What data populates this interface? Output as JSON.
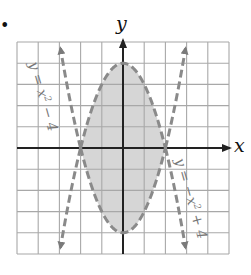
{
  "bullet": "•",
  "chart_data": {
    "type": "line",
    "title": "",
    "xlabel": "x",
    "ylabel": "y",
    "xlim": [
      -5,
      5
    ],
    "ylim": [
      -5,
      5
    ],
    "grid": true,
    "grid_step": 1,
    "shaded_region": "region between y = x^2 - 4 and y = -x^2 + 4 for -2 < x < 2",
    "intersections": [
      [
        -2,
        0
      ],
      [
        2,
        0
      ]
    ],
    "series": [
      {
        "name": "y = x^2 - 4",
        "style": "dashed",
        "vertex": [
          0,
          -4
        ],
        "points": [
          [
            -3,
            5
          ],
          [
            -2,
            0
          ],
          [
            -1,
            -3
          ],
          [
            0,
            -4
          ],
          [
            1,
            -3
          ],
          [
            2,
            0
          ],
          [
            3,
            5
          ]
        ]
      },
      {
        "name": "y = -x^2 + 4",
        "style": "dashed",
        "vertex": [
          0,
          4
        ],
        "points": [
          [
            -3,
            -5
          ],
          [
            -2,
            0
          ],
          [
            -1,
            3
          ],
          [
            0,
            4
          ],
          [
            1,
            3
          ],
          [
            2,
            0
          ],
          [
            3,
            -5
          ]
        ]
      }
    ],
    "annotations": [
      {
        "text": "y = x² − 4",
        "position": "upper-left, rotated along curve"
      },
      {
        "text": "y = −x² + 4",
        "position": "lower-right, rotated along curve"
      }
    ],
    "colors": {
      "shade": "#d6d6d6",
      "grid": "#a8a8a8",
      "axes": "#222222",
      "curves": "#8a8a8a"
    }
  },
  "labels": {
    "x_axis": "x",
    "y_axis": "y",
    "curve1": "y = x",
    "curve1_exp": "2",
    "curve1_tail": " − 4",
    "curve2": "y = −x",
    "curve2_exp": "2",
    "curve2_tail": " + 4"
  }
}
